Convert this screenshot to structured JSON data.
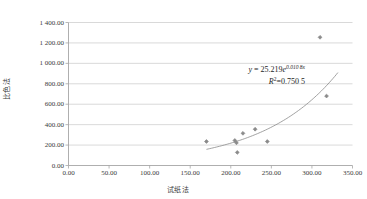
{
  "chart_data": {
    "type": "scatter",
    "title": "",
    "subtitle": "",
    "xlabel": "试纸法",
    "ylabel": "比色法",
    "xlim": [
      0,
      350
    ],
    "ylim": [
      0,
      1400
    ],
    "xticks": [
      "0.00",
      "50.00",
      "100.00",
      "150.00",
      "200.00",
      "250.00",
      "300.00",
      "350.00"
    ],
    "xtick_values": [
      0,
      50,
      100,
      150,
      200,
      250,
      300,
      350
    ],
    "yticks": [
      "0.00",
      "200.00",
      "400.00",
      "600.00",
      "800.00",
      "1 000.00",
      "1 200.00",
      "1 400.00"
    ],
    "ytick_values": [
      0,
      200,
      400,
      600,
      800,
      1000,
      1200,
      1400
    ],
    "grid": "horizontal",
    "legend": "none",
    "series": [
      {
        "name": "数据点",
        "marker": "diamond",
        "color": "#8a8a8a",
        "points": [
          {
            "x": 170,
            "y": 235
          },
          {
            "x": 205,
            "y": 245
          },
          {
            "x": 207,
            "y": 222
          },
          {
            "x": 208,
            "y": 128
          },
          {
            "x": 215,
            "y": 315
          },
          {
            "x": 230,
            "y": 355
          },
          {
            "x": 245,
            "y": 235
          },
          {
            "x": 310,
            "y": 1255
          },
          {
            "x": 318,
            "y": 680
          }
        ]
      }
    ],
    "trendline": {
      "type": "exponential",
      "color": "#8a8a8a",
      "coefficient": 25.219,
      "exponent": 0.0108,
      "x_start": 170,
      "x_end": 332,
      "equation_prefix": "y",
      "equation_eq": " = ",
      "equation_coef": "25.219",
      "equation_base": "e",
      "equation_exponent": "0.010 8x",
      "r2_label": "R",
      "r2_sup": "2",
      "r2_value": "=0.750 5"
    },
    "axis_color": "#a6a6a6",
    "grid_color": "#c8c8c8",
    "text_color": "#3a3a3a",
    "background": "#ffffff"
  }
}
